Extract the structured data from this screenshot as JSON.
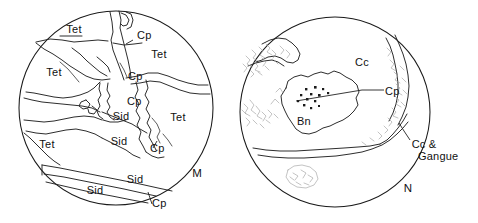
{
  "figure": {
    "background_color": "#ffffff",
    "line_color": "#1a1a1a",
    "texture_color": "#9a9a9a"
  },
  "panels": [
    {
      "id": "M",
      "panel_label": "M",
      "panel_label_x": 197,
      "panel_label_y": 177,
      "circle": {
        "cx": 116,
        "cy": 108,
        "r": 97
      },
      "labels": [
        {
          "text": "Tet",
          "x": 74,
          "y": 33
        },
        {
          "text": "Cp",
          "x": 137,
          "y": 39
        },
        {
          "text": "Tet",
          "x": 159,
          "y": 58
        },
        {
          "text": "Tet",
          "x": 54,
          "y": 76
        },
        {
          "text": "Cp",
          "x": 128,
          "y": 80
        },
        {
          "text": "Cp",
          "x": 127,
          "y": 105
        },
        {
          "text": "Sid",
          "x": 121,
          "y": 120
        },
        {
          "text": "Tet",
          "x": 178,
          "y": 121
        },
        {
          "text": "Tet",
          "x": 47,
          "y": 148
        },
        {
          "text": "Sid",
          "x": 119,
          "y": 145
        },
        {
          "text": "Cp",
          "x": 150,
          "y": 152
        },
        {
          "text": "Sid",
          "x": 135,
          "y": 183
        },
        {
          "text": "Sid",
          "x": 95,
          "y": 194
        },
        {
          "text": "Cp",
          "x": 152,
          "y": 207
        }
      ]
    },
    {
      "id": "N",
      "panel_label": "N",
      "panel_label_x": 408,
      "panel_label_y": 192,
      "circle": {
        "cx": 335,
        "cy": 112,
        "r": 95
      },
      "labels": [
        {
          "text": "Cc",
          "x": 362,
          "y": 66
        },
        {
          "text": "Cp",
          "x": 385,
          "y": 95
        },
        {
          "text": "Bn",
          "x": 304,
          "y": 125
        },
        {
          "text": "Cc &",
          "x": 424,
          "y": 148
        },
        {
          "text": "Gangue",
          "x": 418,
          "y": 160
        }
      ]
    }
  ],
  "legend_keys": [
    {
      "abbr": "Tet",
      "mineral": "Tetrahedrite"
    },
    {
      "abbr": "Cp",
      "mineral": "Chalcopyrite"
    },
    {
      "abbr": "Sid",
      "mineral": "Siderite"
    },
    {
      "abbr": "Cc",
      "mineral": "Chalcocite"
    },
    {
      "abbr": "Bn",
      "mineral": "Bornite"
    },
    {
      "abbr": "Gangue",
      "mineral": "Gangue"
    }
  ]
}
